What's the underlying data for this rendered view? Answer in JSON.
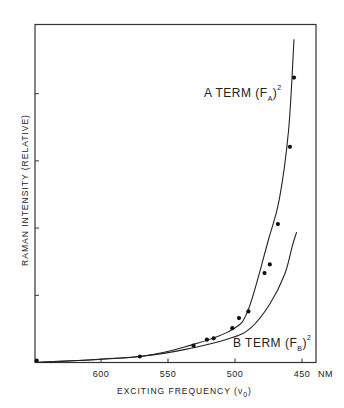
{
  "chart_data": {
    "type": "scatter",
    "title": "",
    "xlabel": "EXCITING FREQUENCY (ν0)",
    "xlabel_main": "EXCITING FREQUENCY (ν",
    "xlabel_sub": "0",
    "xlabel_close": ")",
    "ylabel": "RAMAN INTENSITY (RELATIVE)",
    "x_unit": "NM",
    "x_ticks": [
      600,
      550,
      500,
      450
    ],
    "x_tick_labels": [
      "600",
      "550",
      "500",
      "450"
    ],
    "xlim": [
      650,
      440
    ],
    "x_reversed": true,
    "y_ticks": [
      1,
      2,
      3,
      4
    ],
    "y_tick_labels": [],
    "ylim": [
      0,
      5.05
    ],
    "grid": false,
    "legend": null,
    "series": [
      {
        "name": "Experimental points",
        "kind": "scatter",
        "x": [
          648,
          571,
          531,
          521,
          516,
          502,
          497,
          490,
          478,
          474,
          468,
          459,
          456
        ],
        "y": [
          0.03,
          0.09,
          0.25,
          0.34,
          0.36,
          0.51,
          0.66,
          0.76,
          1.33,
          1.46,
          2.06,
          3.21,
          4.24
        ]
      },
      {
        "name": "A TERM (F_A)^2",
        "kind": "line",
        "x": [
          648,
          571,
          531,
          502,
          490,
          475,
          467,
          460,
          456
        ],
        "y": [
          0.0,
          0.09,
          0.27,
          0.49,
          0.79,
          1.83,
          2.42,
          3.46,
          4.81
        ]
      },
      {
        "name": "B TERM (F_B)^2",
        "kind": "line",
        "x": [
          648,
          571,
          531,
          502,
          488,
          474,
          463,
          457,
          454
        ],
        "y": [
          0.0,
          0.09,
          0.22,
          0.37,
          0.52,
          0.87,
          1.31,
          1.75,
          1.94
        ]
      }
    ],
    "annotations": [
      {
        "text": "A TERM (F_A)^2",
        "main": "A TERM (F",
        "sub": "A",
        "close": ")",
        "sup": "2"
      },
      {
        "text": "B TERM (F_B)^2",
        "main": "B TERM (F",
        "sub": "B",
        "close": ")",
        "sup": "2"
      }
    ]
  }
}
